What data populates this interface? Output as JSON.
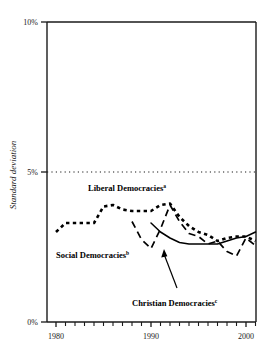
{
  "chart_data": {
    "type": "line",
    "title": "",
    "xlabel": "",
    "ylabel": "Standard deviation",
    "xlim": [
      1980,
      2001
    ],
    "ylim": [
      0,
      10
    ],
    "y_ticks": [
      "0%",
      "5%",
      "10%"
    ],
    "y_tick_values": [
      0,
      5,
      10
    ],
    "x_ticks": [
      "1980",
      "1990",
      "2000"
    ],
    "x_tick_values": [
      1980,
      1990,
      2000
    ],
    "grid": "dotted horizontal gridline at 5%",
    "legend": "inline labels",
    "series": [
      {
        "name": "Liberal Democracies",
        "footnote": "a",
        "style": "dotted",
        "x": [
          1980,
          1981,
          1982,
          1983,
          1984,
          1985,
          1986,
          1987,
          1988,
          1989,
          1990,
          1991,
          1992,
          1993,
          1994,
          1995,
          1996,
          1997,
          1998,
          1999,
          2000,
          2001
        ],
        "values": [
          3.0,
          3.3,
          3.3,
          3.3,
          3.3,
          3.85,
          3.9,
          3.75,
          3.7,
          3.7,
          3.7,
          3.9,
          3.95,
          3.5,
          3.2,
          3.0,
          2.9,
          2.7,
          2.8,
          2.85,
          2.85,
          2.7
        ]
      },
      {
        "name": "Social Democracies",
        "footnote": "b",
        "style": "dashed",
        "x": [
          1988,
          1989,
          1990,
          1991,
          1992,
          1993,
          1994,
          1995,
          1996,
          1997,
          1998,
          1999,
          2000,
          2001
        ],
        "values": [
          3.35,
          2.75,
          2.45,
          3.1,
          3.9,
          3.35,
          2.95,
          2.85,
          2.6,
          2.7,
          2.35,
          2.2,
          2.8,
          2.55
        ]
      },
      {
        "name": "Christian Democracies",
        "footnote": "c",
        "style": "solid",
        "x": [
          1990,
          1991,
          1992,
          1993,
          1994,
          1995,
          1996,
          1997,
          1998,
          1999,
          2000,
          2001
        ],
        "values": [
          3.3,
          3.0,
          2.8,
          2.65,
          2.6,
          2.6,
          2.6,
          2.6,
          2.7,
          2.8,
          2.85,
          3.0
        ]
      }
    ],
    "annotations": [
      {
        "name": "christian-arrow",
        "text": "",
        "points_to": "Christian Democracies line"
      }
    ]
  },
  "axis": {
    "y_title": "Standard deviation",
    "y_top": "10%",
    "y_mid": "5%",
    "y_bottom": "0%",
    "x_first": "1980",
    "x_second": "1990",
    "x_third": "2000"
  },
  "labels": {
    "liberal": "Liberal Democracies",
    "liberal_sup": "a",
    "social": "Social Democracies",
    "social_sup": "b",
    "christian": "Christian Democracies",
    "christian_sup": "c"
  },
  "colors": {
    "axis": "#1a1a1a",
    "line": "#000000",
    "background": "#ffffff"
  }
}
